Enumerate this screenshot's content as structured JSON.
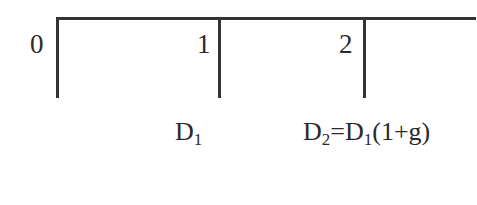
{
  "diagram": {
    "type": "cash-flow-timeline",
    "periods": [
      {
        "label": "0"
      },
      {
        "label": "1"
      },
      {
        "label": "2"
      }
    ],
    "cash_flows": [
      {
        "period": "1",
        "symbol": "D",
        "subscript": "1",
        "expression": ""
      },
      {
        "period": "2",
        "symbol": "D",
        "subscript": "2",
        "expression_eq": "=",
        "expression_symbol": "D",
        "expression_subscript": "1",
        "expression_tail": "(1+g)"
      }
    ],
    "line_color": "#333333",
    "text_color": "#2a2a2a"
  }
}
